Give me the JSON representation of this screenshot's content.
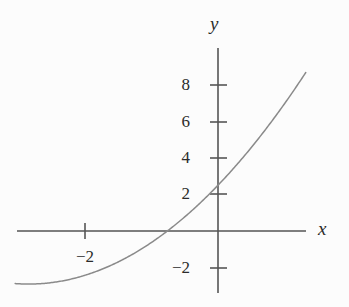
{
  "chart_data": {
    "type": "line",
    "title": "",
    "xlabel": "x",
    "ylabel": "y",
    "grid": false,
    "legend": null,
    "xlim": [
      -3.05,
      1.32
    ],
    "ylim": [
      -3.5,
      10.0
    ],
    "xticks": [
      -2
    ],
    "xtick_labels": [
      "−2"
    ],
    "yticks": [
      -2,
      2,
      4,
      6,
      8
    ],
    "ytick_labels": [
      "−2",
      "2",
      "4",
      "6",
      "8"
    ],
    "series": [
      {
        "name": "parabola",
        "kind": "curve",
        "color": "#8a8a8a",
        "equation": "y = 0.85(x + 2.85)^2 - 2.9",
        "vertex": [
          -2.85,
          -2.9
        ],
        "y_intercept": 2.5,
        "x_intercepts": [
          -0.6,
          -5.1
        ],
        "x": [
          -3.05,
          -2.85,
          -2.6,
          -2.3,
          -2.0,
          -1.7,
          -1.4,
          -1.1,
          -0.8,
          -0.6,
          -0.3,
          0.0,
          0.3,
          0.6,
          0.9,
          1.2,
          1.32
        ],
        "y": [
          -2.86,
          -2.9,
          -2.84,
          -2.62,
          -2.24,
          -1.71,
          -1.02,
          -0.18,
          0.82,
          1.57,
          2.86,
          2.5,
          4.53,
          6.44,
          8.52,
          10.77,
          11.73
        ]
      }
    ],
    "axes_origin_px": [
      218,
      231
    ],
    "x_scale_px_per_unit": 66.5,
    "y_scale_px_per_unit": 18.3
  },
  "labels": {
    "y_axis": "y",
    "x_axis": "x",
    "y_8": "8",
    "y_6": "6",
    "y_4": "4",
    "y_2": "2",
    "y_neg2": "−2",
    "x_neg2": "−2"
  },
  "colors": {
    "background": "#fcfcfc",
    "axis": "#555555",
    "curve": "#8a8a8a",
    "text": "#2b2b2b"
  }
}
